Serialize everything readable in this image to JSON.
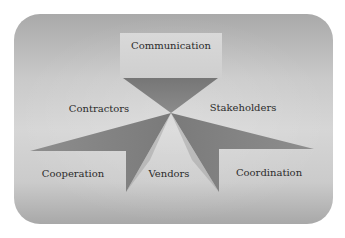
{
  "diagram": {
    "type": "hub-and-spoke",
    "center_label": "",
    "nodes": [
      {
        "id": "communication",
        "label": "Communication",
        "position": "top"
      },
      {
        "id": "contractors",
        "label": "Contractors",
        "position": "upper-left"
      },
      {
        "id": "stakeholders",
        "label": "Stakeholders",
        "position": "upper-right"
      },
      {
        "id": "cooperation",
        "label": "Cooperation",
        "position": "lower-left"
      },
      {
        "id": "vendors",
        "label": "Vendors",
        "position": "bottom-center"
      },
      {
        "id": "coordination",
        "label": "Coordination",
        "position": "lower-right"
      }
    ],
    "colors": {
      "panel_dark": "#a9a9a9",
      "panel_light": "#d6d6d6",
      "shape_fill": "#7d7d7d",
      "text": "#2b2b2b"
    }
  }
}
